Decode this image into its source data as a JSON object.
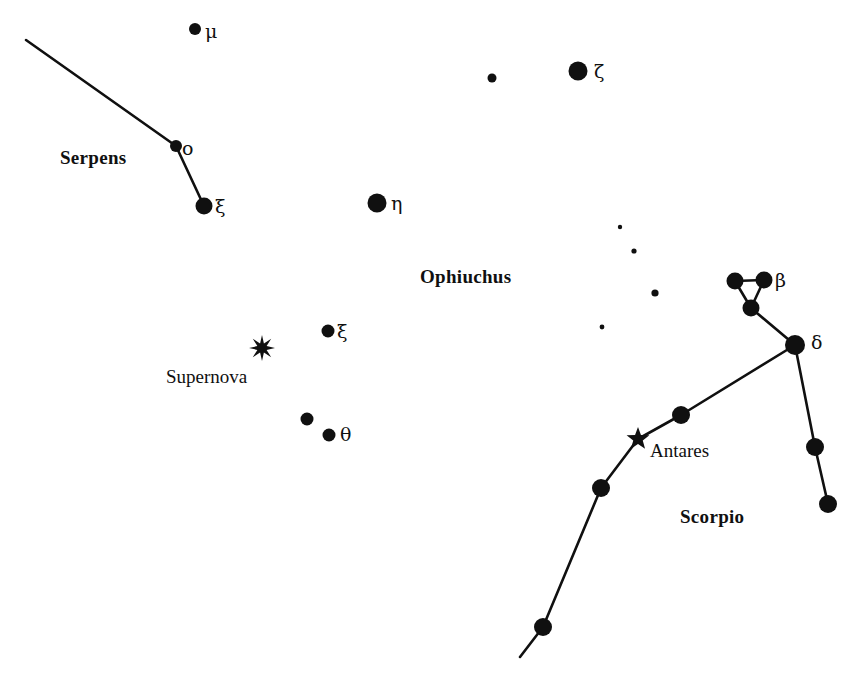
{
  "figure": {
    "kind": "star-chart",
    "width": 861,
    "height": 684,
    "background_color": "#ffffff",
    "ink_color": "#101010"
  },
  "constellation_labels": [
    {
      "id": "serpens",
      "text": "Serpens",
      "x": 60,
      "y": 148,
      "bold": true
    },
    {
      "id": "ophiuchus",
      "text": "Ophiuchus",
      "x": 420,
      "y": 267,
      "bold": true
    },
    {
      "id": "scorpio",
      "text": "Scorpio",
      "x": 680,
      "y": 507,
      "bold": true
    }
  ],
  "object_labels": [
    {
      "id": "supernova",
      "text": "Supernova",
      "x": 166,
      "y": 367,
      "bold": false
    },
    {
      "id": "antares",
      "text": "Antares",
      "x": 650,
      "y": 441,
      "bold": false
    }
  ],
  "greek_labels": [
    {
      "id": "mu-label",
      "text": "μ",
      "x": 205,
      "y": 22
    },
    {
      "id": "zeta-label",
      "text": "ζ",
      "x": 594,
      "y": 62
    },
    {
      "id": "eta-label",
      "text": "η",
      "x": 391,
      "y": 194
    },
    {
      "id": "xi-ser-label",
      "text": "ξ",
      "x": 215,
      "y": 197
    },
    {
      "id": "omicron-label",
      "text": "o",
      "x": 182,
      "y": 139
    },
    {
      "id": "beta-label",
      "text": "β",
      "x": 775,
      "y": 271
    },
    {
      "id": "delta-label",
      "text": "δ",
      "x": 811,
      "y": 333
    },
    {
      "id": "xi-oph-label",
      "text": "ξ",
      "x": 337,
      "y": 322
    },
    {
      "id": "theta-label",
      "text": "θ",
      "x": 340,
      "y": 425
    }
  ],
  "stars": [
    {
      "id": "serpens-mu",
      "x": 195,
      "y": 29,
      "r": 6.0,
      "shape": "disk"
    },
    {
      "id": "ophiuchus-faint-1",
      "x": 492,
      "y": 78,
      "r": 4.5,
      "shape": "disk"
    },
    {
      "id": "ophiuchus-zeta",
      "x": 578,
      "y": 71,
      "r": 9.5,
      "shape": "disk"
    },
    {
      "id": "serpens-omicron",
      "x": 176,
      "y": 146,
      "r": 6.0,
      "shape": "disk"
    },
    {
      "id": "serpens-xi",
      "x": 204,
      "y": 206,
      "r": 8.5,
      "shape": "disk"
    },
    {
      "id": "ophiuchus-eta",
      "x": 377,
      "y": 203,
      "r": 9.5,
      "shape": "disk"
    },
    {
      "id": "ophiuchus-faint-2",
      "x": 620,
      "y": 227,
      "r": 2.2,
      "shape": "disk"
    },
    {
      "id": "ophiuchus-faint-3",
      "x": 634,
      "y": 251,
      "r": 2.6,
      "shape": "disk"
    },
    {
      "id": "scorpio-head-left",
      "x": 735,
      "y": 281,
      "r": 8.5,
      "shape": "disk"
    },
    {
      "id": "scorpio-beta",
      "x": 764,
      "y": 280,
      "r": 8.5,
      "shape": "disk"
    },
    {
      "id": "ophiuchus-faint-4",
      "x": 655,
      "y": 293,
      "r": 3.6,
      "shape": "disk"
    },
    {
      "id": "scorpio-head-low",
      "x": 751,
      "y": 308,
      "r": 8.5,
      "shape": "disk"
    },
    {
      "id": "ophiuchus-faint-5",
      "x": 602,
      "y": 327,
      "r": 2.4,
      "shape": "disk"
    },
    {
      "id": "ophiuchus-xi",
      "x": 328,
      "y": 331,
      "r": 6.5,
      "shape": "disk"
    },
    {
      "id": "scorpio-delta",
      "x": 795,
      "y": 345,
      "r": 10.0,
      "shape": "disk"
    },
    {
      "id": "ophiuchus-dot-a",
      "x": 307,
      "y": 419,
      "r": 6.5,
      "shape": "disk"
    },
    {
      "id": "scorpio-sigma",
      "x": 681,
      "y": 415,
      "r": 9.0,
      "shape": "disk"
    },
    {
      "id": "ophiuchus-theta",
      "x": 329,
      "y": 435,
      "r": 6.5,
      "shape": "disk"
    },
    {
      "id": "scorpio-pi",
      "x": 815,
      "y": 447,
      "r": 9.0,
      "shape": "disk"
    },
    {
      "id": "scorpio-tau",
      "x": 601,
      "y": 488,
      "r": 9.0,
      "shape": "disk"
    },
    {
      "id": "scorpio-rho",
      "x": 828,
      "y": 504,
      "r": 9.0,
      "shape": "disk"
    },
    {
      "id": "scorpio-epsilon",
      "x": 543,
      "y": 627,
      "r": 9.0,
      "shape": "disk"
    }
  ],
  "marker_stars": [
    {
      "id": "supernova-marker",
      "x": 262,
      "y": 348,
      "points": 8,
      "outer_r": 13,
      "inner_r": 5.0,
      "shape": "burst"
    },
    {
      "id": "antares-marker",
      "x": 638,
      "y": 439,
      "points": 5,
      "outer_r": 12,
      "inner_r": 5.0,
      "shape": "star"
    }
  ],
  "constellation_lines": [
    {
      "id": "serpens-tail",
      "points": "26,40 176,146"
    },
    {
      "id": "serpens-omicron-xi",
      "points": "176,146 204,206"
    },
    {
      "id": "scorpio-head-top",
      "points": "735,281 764,280"
    },
    {
      "id": "scorpio-head-left-s",
      "points": "735,281 751,308"
    },
    {
      "id": "scorpio-head-right-s",
      "points": "764,280 751,308"
    },
    {
      "id": "scorpio-head-delta",
      "points": "751,308 795,345"
    },
    {
      "id": "scorpio-delta-pi",
      "points": "795,345 815,447"
    },
    {
      "id": "scorpio-pi-rho",
      "points": "815,447 828,504"
    },
    {
      "id": "scorpio-body",
      "points": "795,345 681,415 638,439 601,488 543,627 520,657"
    }
  ]
}
